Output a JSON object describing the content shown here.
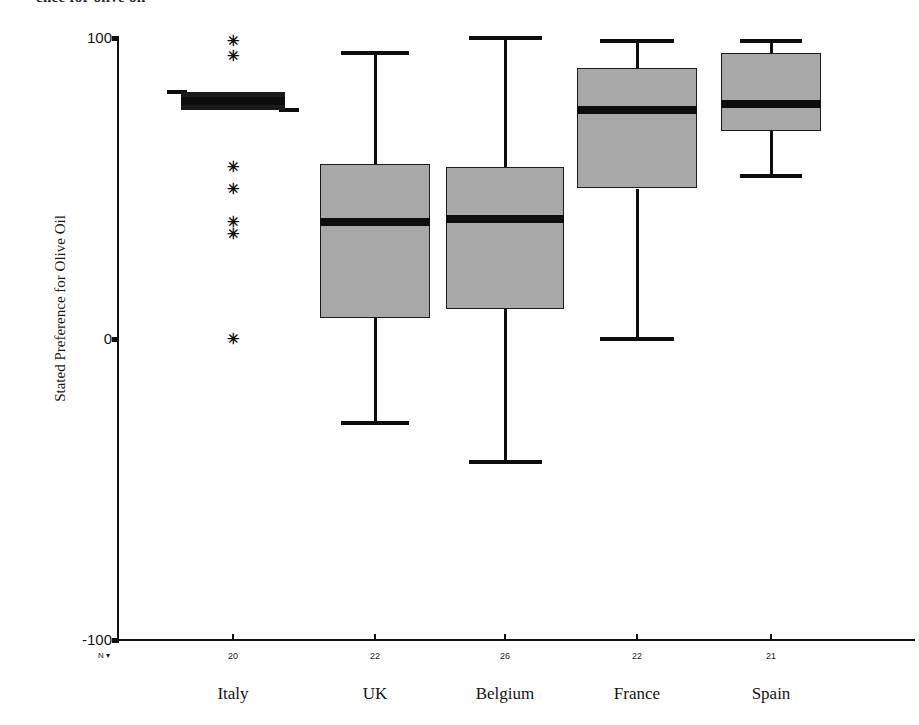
{
  "caption": {
    "text": "ence for olive oil",
    "note": "clipped text row at top edge of figure"
  },
  "axes": {
    "ylabel": "Stated Preference for Olive Oil",
    "n_legend": "N ▾",
    "yticks": [
      {
        "label": "100",
        "value": 100
      },
      {
        "label": "0",
        "value": 0
      },
      {
        "label": "-100",
        "value": -100
      }
    ]
  },
  "chart_data": {
    "type": "box",
    "title": "",
    "xlabel": "",
    "ylabel": "Stated Preference for Olive Oil",
    "ylim": [
      -100,
      100
    ],
    "yticks": [
      100,
      0,
      -100
    ],
    "grid": false,
    "legend": "none",
    "categories": [
      "Italy",
      "UK",
      "Belgium",
      "France",
      "Spain"
    ],
    "counts": [
      20,
      22,
      26,
      22,
      21
    ],
    "boxes": [
      {
        "category": "Italy",
        "n": 20,
        "whisker_low": 76,
        "q1": 76,
        "median": 79,
        "q3": 82,
        "whisker_high": 82,
        "outliers": [
          99,
          94,
          57,
          50,
          39,
          35,
          0
        ]
      },
      {
        "category": "UK",
        "n": 22,
        "whisker_low": -28,
        "q1": 7,
        "median": 39,
        "q3": 58,
        "whisker_high": 95,
        "outliers": []
      },
      {
        "category": "Belgium",
        "n": 26,
        "whisker_low": -41,
        "q1": 10,
        "median": 40,
        "q3": 57,
        "whisker_high": 100,
        "outliers": []
      },
      {
        "category": "France",
        "n": 22,
        "whisker_low": 0,
        "q1": 50,
        "median": 76,
        "q3": 90,
        "whisker_high": 99,
        "outliers": []
      },
      {
        "category": "Spain",
        "n": 21,
        "whisker_low": 54,
        "q1": 69,
        "median": 78,
        "q3": 95,
        "whisker_high": 99,
        "outliers": []
      }
    ]
  },
  "style": {
    "box_fill": "#a8a8a8",
    "line_color": "#0d0d0d",
    "background": "#ffffff"
  }
}
